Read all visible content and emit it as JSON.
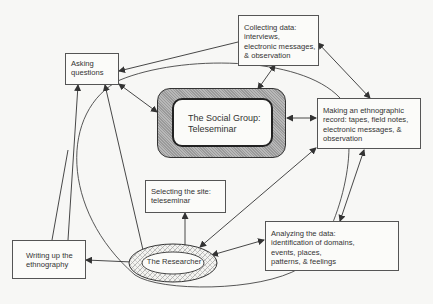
{
  "diagram": {
    "center": {
      "lines": [
        "The Social Group:",
        "Teleseminar"
      ]
    },
    "researcher": {
      "label": "The Researcher"
    },
    "nodes": {
      "asking": {
        "lines": [
          "Asking",
          "questions"
        ]
      },
      "collecting": {
        "lines": [
          "Collecting data:",
          "interviews,",
          "electronic messages,",
          "& observation"
        ]
      },
      "making_record": {
        "lines": [
          "Making an ethnographic",
          "record:  tapes, field notes,",
          "electronic messages, &",
          "observation"
        ]
      },
      "selecting": {
        "lines": [
          "Selecting the site:",
          "teleseminar"
        ]
      },
      "writing": {
        "lines": [
          "Writing up the",
          "ethnography"
        ]
      },
      "analyzing": {
        "lines": [
          "Analyzing the data:",
          "identification of domains,",
          "events, places,",
          "patterns, & feelings"
        ]
      }
    },
    "colors": {
      "line": "#333333",
      "box_border": "#555555",
      "background": "#f7f7f5",
      "hatch": "#9a9a9a"
    }
  }
}
